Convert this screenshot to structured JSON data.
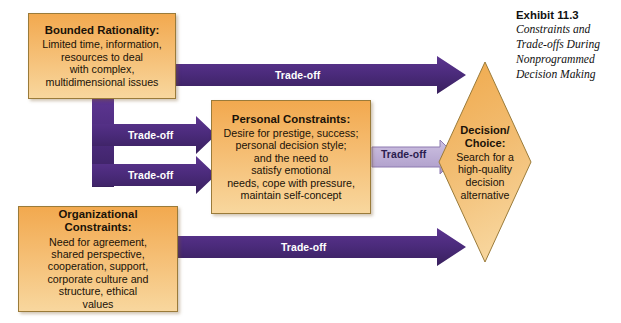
{
  "exhibit": {
    "number": "Exhibit 11.3",
    "caption": "Constraints and Trade-offs During Nonprogrammed Decision Making"
  },
  "nodes": {
    "bounded_rationality": {
      "title": "Bounded Rationality:",
      "lines": [
        "Limited time, information,",
        "resources to deal",
        "with complex,",
        "multidimensional issues"
      ]
    },
    "personal_constraints": {
      "title": "Personal Constraints:",
      "lines": [
        "Desire for prestige, success;",
        "personal decision style;",
        "and the need to",
        "satisfy emotional",
        "needs, cope with pressure,",
        "maintain self-concept"
      ]
    },
    "organizational_constraints": {
      "title": "Organizational Constraints:",
      "lines": [
        "Need for agreement,",
        "shared perspective,",
        "cooperation, support,",
        "corporate culture and",
        "structure, ethical",
        "values"
      ]
    },
    "decision_choice": {
      "title_line1": "Decision/",
      "title_line2": "Choice:",
      "lines": [
        "Search for a",
        "high-quality",
        "decision",
        "alternative"
      ]
    }
  },
  "arrows": {
    "bounded_to_decision": "Trade-off",
    "bounded_to_personal": "Trade-off",
    "org_to_personal": "Trade-off",
    "personal_to_decision": "Trade-off",
    "org_to_decision": "Trade-off"
  },
  "colors": {
    "arrow_dark": "#4a2a7a",
    "arrow_light": "#bdaed6",
    "box_fill_top": "#f2a94f",
    "box_fill_bottom": "#f8d79e",
    "box_border": "#9a7b3a",
    "diamond_fill": "#f0b461",
    "text_dark": "#1a1208"
  }
}
